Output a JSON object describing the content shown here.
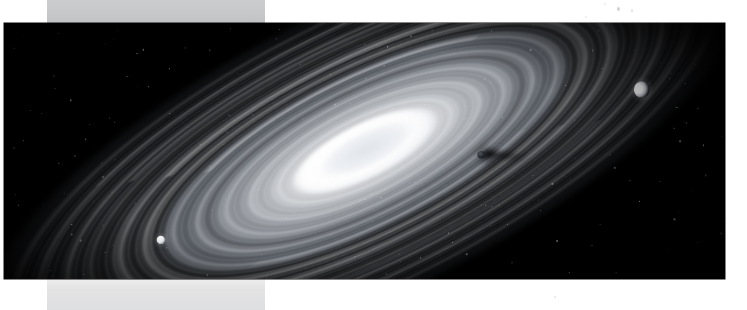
{
  "viewer": {
    "background_color": "#ffffff",
    "band_top_color": "#c9cbcc",
    "band_bottom_color": "#e3e3e4",
    "plate_color": "#000000"
  },
  "plate": {
    "alt_text": "Black-and-white astronomical plate of a banded ring system / spiral galaxy seen at an oblique angle",
    "subject": "Ringed planetary system with concentric ring bands and satellites",
    "orientation": "Major axis running from lower-left to upper-right",
    "frame": {
      "x": 4,
      "y": 23,
      "width": 721,
      "height": 256
    }
  },
  "features": [
    {
      "id": "core",
      "label": "Bright central bulge",
      "interactable": false
    },
    {
      "id": "ring-bands",
      "label": "Concentric ring bands",
      "interactable": false
    },
    {
      "id": "dust-gap",
      "label": "Dark ring division",
      "interactable": false
    }
  ],
  "satellites": [
    {
      "id": "moon-crescent",
      "label": "Crescent-lit moon",
      "x": 626,
      "y": 70,
      "brightness": "bright"
    },
    {
      "id": "moon-small",
      "label": "Small bright moon",
      "x": 164,
      "y": 212,
      "brightness": "bright"
    },
    {
      "id": "moon-dark",
      "label": "Dark moon with shadow trail",
      "x": 473,
      "y": 133,
      "brightness": "dark"
    }
  ],
  "specks": [
    {
      "id": "speck-1",
      "x": 617,
      "y": 7
    },
    {
      "id": "speck-2",
      "x": 631,
      "y": 9
    },
    {
      "id": "speck-3",
      "x": 604,
      "y": 3
    },
    {
      "id": "speck-4",
      "x": 554,
      "y": 296
    },
    {
      "id": "speck-5",
      "x": 585,
      "y": 16
    }
  ]
}
